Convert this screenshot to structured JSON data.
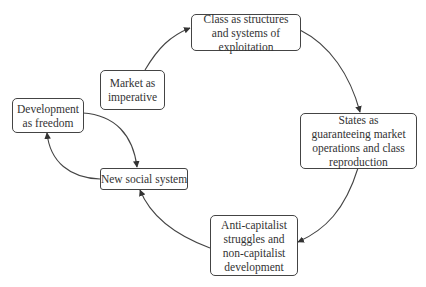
{
  "diagram": {
    "nodes": [
      {
        "id": "market",
        "label": "Market as imperative"
      },
      {
        "id": "class",
        "label": "Class as structures and systems of exploitation"
      },
      {
        "id": "states",
        "label": "States as guaranteeing market operations and class reproduction"
      },
      {
        "id": "anti",
        "label": "Anti-capitalist struggles and non-capitalist development"
      },
      {
        "id": "newsys",
        "label": "New social system"
      },
      {
        "id": "devfree",
        "label": "Development as freedom"
      }
    ],
    "edges": [
      {
        "from": "market",
        "to": "class"
      },
      {
        "from": "class",
        "to": "states"
      },
      {
        "from": "states",
        "to": "anti"
      },
      {
        "from": "anti",
        "to": "newsys"
      },
      {
        "from": "newsys",
        "to": "devfree"
      },
      {
        "from": "devfree",
        "to": "newsys"
      }
    ],
    "colors": {
      "stroke": "#444444",
      "text": "#333333",
      "background": "#ffffff"
    }
  }
}
